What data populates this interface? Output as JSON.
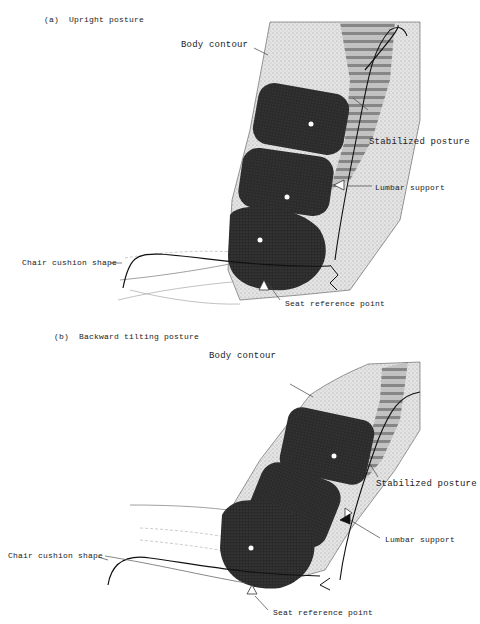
{
  "panels": [
    {
      "id": "a",
      "caption_letter": "(a)",
      "caption": "Upright posture",
      "labels": {
        "body_contour": "Body contour",
        "stabilized_posture": "Stabilized posture",
        "lumbar_support": "Lumbar support",
        "chair_cushion_shape": "Chair cushion shape",
        "seat_reference_point": "Seat reference point"
      }
    },
    {
      "id": "b",
      "caption_letter": "(b)",
      "caption": "Backward tilting posture",
      "labels": {
        "body_contour": "Body contour",
        "stabilized_posture": "Stabilized posture",
        "lumbar_support": "Lumbar support",
        "chair_cushion_shape": "Chair cushion shape",
        "seat_reference_point": "Seat reference point"
      }
    }
  ],
  "colors": {
    "pad": "#2a2a2a",
    "body": "#d8d8d8",
    "spine": "#9a9a9a",
    "line": "#222222"
  }
}
